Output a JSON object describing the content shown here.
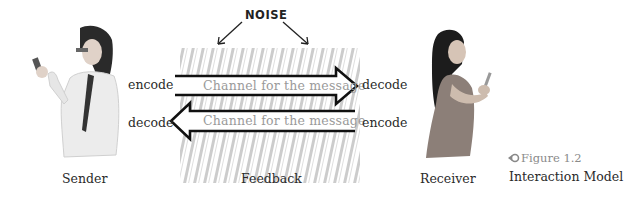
{
  "noise_label": "NOISE",
  "sender": {
    "caption": "Sender",
    "encode": "encode",
    "decode": "decode"
  },
  "receiver": {
    "caption": "Receiver",
    "decode": "decode",
    "encode": "encode"
  },
  "feedback": {
    "caption": "Feedback"
  },
  "channels": [
    {
      "label": "Channel for the message",
      "direction": "right"
    },
    {
      "label": "Channel for the message",
      "direction": "left"
    }
  ],
  "figure": {
    "number": "Figure 1.2",
    "title": "Interaction Model",
    "icon": "arrow-left-circle-icon"
  },
  "colors": {
    "outline": "#111111",
    "noise": "#b8b8b8",
    "channel_text": "#9a9a9a"
  }
}
